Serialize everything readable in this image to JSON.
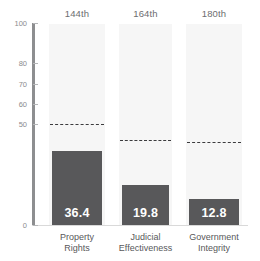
{
  "chart_data": {
    "type": "bar",
    "title": "",
    "subtitle": "",
    "xlabel": "",
    "ylabel": "",
    "ylim": [
      0,
      100
    ],
    "grid": false,
    "legend": "none",
    "categories": [
      "Property\nRights",
      "Judicial\nEffectiveness",
      "Government\nIntegrity"
    ],
    "values": [
      36.4,
      19.8,
      12.8
    ],
    "value_labels": [
      "36.4",
      "19.8",
      "12.8"
    ],
    "rank_labels": [
      "144th",
      "164th",
      "180th"
    ],
    "y_tick_labels": [
      "100",
      "80",
      "70",
      "60",
      "50",
      "0"
    ],
    "y_tick_values": [
      100,
      80,
      70,
      60,
      50,
      0
    ],
    "reference_lines": {
      "label": "world average",
      "values": [
        50.0,
        42.3,
        41.2
      ]
    },
    "series": [
      {
        "name": "score",
        "values": [
          36.4,
          19.8,
          12.8
        ]
      }
    ],
    "colors": {
      "bar": "#58585a",
      "band": "#f6f6f6",
      "axis": "#8d8e90",
      "tick_text": "#8a8b8d",
      "rank_text": "#6d6e70",
      "category_text": "#58585a",
      "value_text": "#ffffff",
      "refline": "#3b3b3d",
      "background": "#ffffff"
    }
  }
}
